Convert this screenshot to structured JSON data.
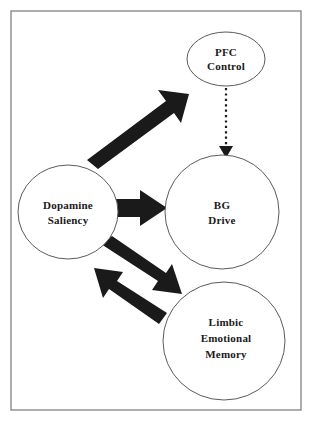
{
  "diagram": {
    "type": "node-link-diagram",
    "background_color": "#ffffff",
    "frame": {
      "name": "outer-border",
      "stroke_color": "#8a8a8a",
      "x": 11,
      "y": 11,
      "width": 290,
      "height": 399
    },
    "nodes": [
      {
        "id": "pfc-control",
        "label_lines": [
          "PFC",
          "Control"
        ],
        "shape": "ellipse",
        "cx": 226,
        "cy": 59,
        "rx": 39,
        "ry": 27,
        "fill": "#ffffff",
        "stroke": "#5a5a5a"
      },
      {
        "id": "dopamine-saliency",
        "label_lines": [
          "Dopamine",
          "Saliency"
        ],
        "shape": "ellipse",
        "cx": 68,
        "cy": 212,
        "rx": 50,
        "ry": 47,
        "fill": "#ffffff",
        "stroke": "#5a5a5a"
      },
      {
        "id": "bg-drive",
        "label_lines": [
          "BG",
          "Drive"
        ],
        "shape": "ellipse",
        "cx": 222,
        "cy": 212,
        "rx": 57,
        "ry": 57,
        "fill": "#ffffff",
        "stroke": "#5a5a5a"
      },
      {
        "id": "limbic-emotional-memory",
        "label_lines": [
          "Limbic",
          "Emotional",
          "Memory"
        ],
        "shape": "ellipse",
        "cx": 224,
        "cy": 341,
        "rx": 61,
        "ry": 59,
        "fill": "#ffffff",
        "stroke": "#5a5a5a"
      }
    ],
    "edges": [
      {
        "id": "dopamine-to-pfc",
        "from": "dopamine-saliency",
        "to": "pfc-control",
        "style": "thick-solid-arrow",
        "color": "#1a1a1a",
        "direction": "up-right"
      },
      {
        "id": "pfc-to-bg",
        "from": "pfc-control",
        "to": "bg-drive",
        "style": "dotted-arrow",
        "color": "#1a1a1a",
        "direction": "down"
      },
      {
        "id": "dopamine-to-bg",
        "from": "dopamine-saliency",
        "to": "bg-drive",
        "style": "thick-solid-arrow",
        "color": "#1a1a1a",
        "direction": "right"
      },
      {
        "id": "dopamine-to-limbic",
        "from": "dopamine-saliency",
        "to": "limbic-emotional-memory",
        "style": "thick-solid-arrow",
        "color": "#1a1a1a",
        "direction": "down-right"
      },
      {
        "id": "limbic-to-dopamine",
        "from": "limbic-emotional-memory",
        "to": "dopamine-saliency",
        "style": "thick-solid-arrow",
        "color": "#1a1a1a",
        "direction": "up-left"
      }
    ]
  }
}
